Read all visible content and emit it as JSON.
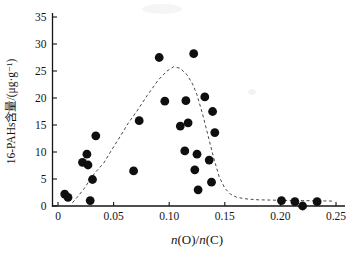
{
  "figure": {
    "background": "#ffffff",
    "ink_color": "#141414",
    "dot_color": "#0f0f0f",
    "curve_color": "#4a4a4a"
  },
  "chart_data": {
    "type": "scatter",
    "title": "",
    "xlabel": "n(O)/n(C)",
    "ylabel": "16-PAHs含量/(μg·g⁻¹)",
    "xlim": [
      0,
      0.25
    ],
    "ylim": [
      0,
      35
    ],
    "x_ticks": [
      0,
      0.05,
      0.1,
      0.15,
      0.2,
      0.25
    ],
    "x_tick_labels": [
      "0",
      "0.05",
      "0.10",
      "0.15",
      "0.20",
      "0.25"
    ],
    "y_ticks": [
      0,
      5,
      10,
      15,
      20,
      25,
      30,
      35
    ],
    "y_tick_labels": [
      "0",
      "5",
      "10",
      "15",
      "20",
      "25",
      "30",
      "35"
    ],
    "grid": false,
    "legend": "none",
    "series": [
      {
        "name": "sample-points",
        "type": "scatter",
        "marker": "filled-circle",
        "color": "#0f0f0f",
        "points": [
          [
            0.006,
            2.2
          ],
          [
            0.009,
            1.6
          ],
          [
            0.029,
            1.0
          ],
          [
            0.022,
            8.1
          ],
          [
            0.027,
            7.6
          ],
          [
            0.026,
            9.6
          ],
          [
            0.031,
            4.9
          ],
          [
            0.034,
            13.0
          ],
          [
            0.068,
            6.5
          ],
          [
            0.073,
            15.8
          ],
          [
            0.091,
            27.5
          ],
          [
            0.096,
            19.4
          ],
          [
            0.11,
            14.8
          ],
          [
            0.114,
            10.2
          ],
          [
            0.115,
            19.5
          ],
          [
            0.117,
            15.4
          ],
          [
            0.122,
            28.2
          ],
          [
            0.123,
            6.7
          ],
          [
            0.125,
            9.6
          ],
          [
            0.126,
            3.0
          ],
          [
            0.132,
            20.2
          ],
          [
            0.136,
            8.5
          ],
          [
            0.138,
            4.4
          ],
          [
            0.139,
            17.5
          ],
          [
            0.141,
            13.6
          ],
          [
            0.201,
            1.0
          ],
          [
            0.213,
            0.8
          ],
          [
            0.22,
            0.0
          ],
          [
            0.233,
            0.8
          ]
        ]
      },
      {
        "name": "fitted-trend-curve",
        "type": "line",
        "style": "dashed",
        "color": "#4a4a4a",
        "points": [
          [
            0.013,
            0.6
          ],
          [
            0.018,
            1.8
          ],
          [
            0.023,
            3.1
          ],
          [
            0.028,
            4.6
          ],
          [
            0.033,
            6.1
          ],
          [
            0.041,
            7.9
          ],
          [
            0.048,
            10.3
          ],
          [
            0.055,
            12.6
          ],
          [
            0.063,
            15.3
          ],
          [
            0.071,
            17.6
          ],
          [
            0.08,
            20.4
          ],
          [
            0.09,
            23.3
          ],
          [
            0.098,
            25.0
          ],
          [
            0.104,
            25.8
          ],
          [
            0.11,
            25.5
          ],
          [
            0.116,
            24.3
          ],
          [
            0.121,
            22.6
          ],
          [
            0.125,
            20.6
          ],
          [
            0.13,
            17.0
          ],
          [
            0.135,
            13.0
          ],
          [
            0.14,
            8.9
          ],
          [
            0.145,
            5.4
          ],
          [
            0.15,
            3.3
          ],
          [
            0.155,
            2.2
          ],
          [
            0.161,
            1.6
          ],
          [
            0.17,
            1.3
          ],
          [
            0.18,
            1.15
          ],
          [
            0.2,
            1.05
          ],
          [
            0.22,
            1.0
          ],
          [
            0.235,
            0.95
          ],
          [
            0.248,
            0.9
          ]
        ]
      }
    ]
  }
}
